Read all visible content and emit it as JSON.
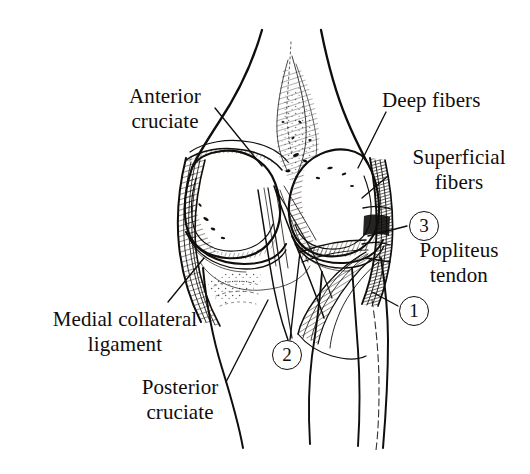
{
  "figure": {
    "background_color": "#ffffff",
    "ink_color": "#100d0b",
    "view": "posterior",
    "style": "pen-and-ink line drawing"
  },
  "labels": {
    "anterior_cruciate": "Anterior\ncruciate",
    "deep_fibers": "Deep fibers",
    "superficial_fibers": "Superficial\nfibers",
    "popliteus_tendon": "Popliteus\ntendon",
    "medial_collateral_ligament": "Medial collateral\nligament",
    "posterior_cruciate": "Posterior\ncruciate"
  },
  "markers": {
    "one": "1",
    "two": "2",
    "three": "3"
  },
  "structures": [
    {
      "name": "femur-shaft",
      "label": ""
    },
    {
      "name": "medial-femoral-condyle",
      "label": ""
    },
    {
      "name": "lateral-femoral-condyle",
      "label": ""
    },
    {
      "name": "intercondylar-notch",
      "label": ""
    },
    {
      "name": "tibia-shaft",
      "label": ""
    },
    {
      "name": "fibula-shaft",
      "label": ""
    },
    {
      "name": "medial-collateral-ligament",
      "label": "Medial collateral ligament"
    },
    {
      "name": "lateral-collateral-ligament",
      "label": ""
    },
    {
      "name": "popliteus-tendon",
      "label": "Popliteus tendon"
    },
    {
      "name": "anterior-cruciate-ligament",
      "label": "Anterior cruciate"
    },
    {
      "name": "posterior-cruciate-ligament",
      "label": "Posterior cruciate"
    }
  ]
}
